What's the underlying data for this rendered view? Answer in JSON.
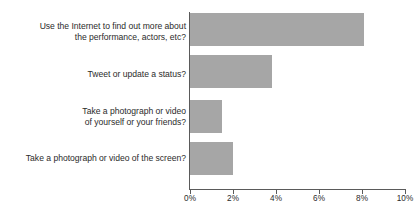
{
  "chart_data": {
    "type": "bar",
    "orientation": "horizontal",
    "title": "",
    "subtitle": "",
    "xlabel": "",
    "ylabel": "",
    "categories": [
      "Use the Internet to find out more about\nthe performance, actors, etc?",
      "Tweet or update a status?",
      "Take a photograph or video\nof yourself or your friends?",
      "Take a photograph or video of the screen?"
    ],
    "values": [
      8.1,
      3.8,
      1.5,
      2.0
    ],
    "value_suffix": "%",
    "xlim": [
      0,
      10
    ],
    "xticks": [
      0,
      2,
      4,
      6,
      8,
      10
    ],
    "xtick_labels": [
      "0%",
      "2%",
      "4%",
      "6%",
      "8%",
      "10%"
    ],
    "grid": false,
    "legend": false,
    "bar_color": "#a6a6a6",
    "axis_color": "#5a5a5a",
    "text_color": "#2b2b2b",
    "background_color": "#ffffff"
  }
}
